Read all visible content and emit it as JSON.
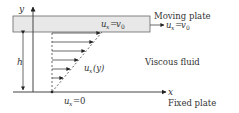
{
  "labels": {
    "y_axis": "y",
    "x_axis": "x",
    "height": "h",
    "moving_plate": "Moving plate",
    "fixed_plate": "Fixed plate",
    "viscous_fluid": "Viscous fluid",
    "top_velocity_var": "u",
    "top_velocity_sub": "x",
    "top_velocity_eq": "=",
    "top_velocity_val": "v",
    "top_velocity_val_sub": "0",
    "profile_var": "u",
    "profile_sub": "x",
    "profile_arg": "(y)",
    "bottom_velocity_var": "u",
    "bottom_velocity_sub": "x",
    "bottom_velocity_eq": "=0"
  },
  "colors": {
    "plate_fill": "#e8e8e8",
    "line": "#333333"
  }
}
